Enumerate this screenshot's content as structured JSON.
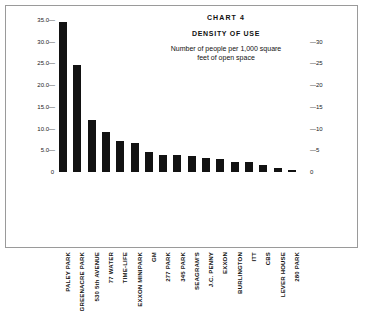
{
  "chart_data": {
    "type": "bar",
    "title": "CHART 4",
    "subtitle": "DENSITY OF USE",
    "description_line1": "Number of people per 1,000 square",
    "description_line2": "feet of open space",
    "xlabel": "",
    "ylabel": "",
    "ylim": [
      0,
      35
    ],
    "grid": false,
    "legend": "none",
    "bar_color": "#121212",
    "categories": [
      "PALEY PARK",
      "GREENACRE PARK",
      "530 5th AVENUE",
      "77 WATER",
      "TIME-LIFE",
      "EXXON MINIPARK",
      "GM",
      "277 PARK",
      "345 PARK",
      "SEAGRAM'S",
      "J.C. PENNY",
      "EXXON",
      "BURLINGTON",
      "ITT",
      "CBS",
      "LEVER HOUSE",
      "280 PARK"
    ],
    "values": [
      34.5,
      24.6,
      12.0,
      9.3,
      7.2,
      6.7,
      4.5,
      4.0,
      4.0,
      3.6,
      3.3,
      2.9,
      2.4,
      2.2,
      1.7,
      0.9,
      0.4
    ],
    "left_axis_ticks": [
      "35.0",
      "30.0",
      "25.0",
      "20.0",
      "15.0",
      "10.0",
      "5.0",
      "0"
    ],
    "left_axis_values": [
      35,
      30,
      25,
      20,
      15,
      10,
      5,
      0
    ],
    "right_axis_ticks": [
      "30",
      "25",
      "20",
      "15",
      "10",
      "5",
      "0"
    ],
    "right_axis_values": [
      30,
      25,
      20,
      15,
      10,
      5,
      0
    ]
  }
}
